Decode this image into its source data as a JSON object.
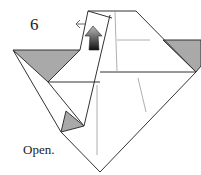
{
  "diagram": {
    "step_number": "6",
    "instruction": "Open.",
    "colors": {
      "line": "#333333",
      "shade": "#a9a9a9",
      "crease": "#9a9a9a",
      "arrow_dark": "#111111",
      "arrow_light": "#bbbbbb"
    },
    "elements": [
      {
        "type": "paper-outline",
        "description": "origami model outline"
      },
      {
        "type": "shaded-flap",
        "position": "left"
      },
      {
        "type": "shaded-flap",
        "position": "right"
      },
      {
        "type": "shaded-flap",
        "position": "lower-left small"
      },
      {
        "type": "open-arrow",
        "description": "push/open arrow at top flap"
      }
    ]
  }
}
